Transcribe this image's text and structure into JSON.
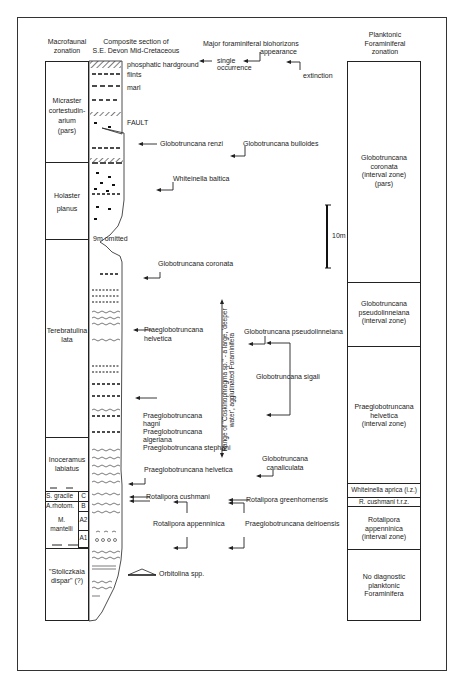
{
  "headers": {
    "macrofaunal": [
      "Macrofaunal",
      "zonation"
    ],
    "composite": [
      "Composite section of",
      "S.E. Devon Mid-Cretaceous"
    ],
    "biohorizons": "Major foraminiferal biohorizons",
    "appearance": "appearance",
    "single": [
      "single",
      "occurrence"
    ],
    "extinction": "extinction",
    "planktonic": [
      "Planktonic",
      "Foraminiferal",
      "zonation"
    ]
  },
  "lithology_labels": {
    "hardground": "phosphatic hardground",
    "flints": "flints",
    "marl": "marl",
    "fault": "FAULT",
    "omitted": "9m omitted"
  },
  "macrofaunal_zones": [
    {
      "lines": [
        "Micraster",
        "cortestudin-",
        "arium",
        "(pars)"
      ]
    },
    {
      "lines": [
        "Holaster",
        "planus"
      ]
    },
    {
      "lines": [
        "Terebratulina",
        "lata"
      ]
    },
    {
      "lines": [
        "Inoceramus",
        "labiatus"
      ]
    },
    {
      "lines": [
        "S. gracile"
      ],
      "sub": "C"
    },
    {
      "lines": [
        "A.rhotom."
      ],
      "sub": "B"
    },
    {
      "lines": [
        "M.",
        "mantelli"
      ],
      "subs": [
        "A2",
        "A1"
      ]
    },
    {
      "lines": [
        "\"Stoliczkaia",
        "dispar\"  (?)"
      ]
    }
  ],
  "biohorizons": [
    {
      "name": "Globotruncana renzi"
    },
    {
      "name": "Globotruncana bulloides"
    },
    {
      "name": "Whiteinella baltica"
    },
    {
      "name": "Globotruncana coronata"
    },
    {
      "name": "Praeglobotruncana helvetica",
      "lines": [
        "Praeglobotruncana",
        "helvetica"
      ]
    },
    {
      "name": "Globotruncana pseudolinneiana"
    },
    {
      "name": "Globotruncana sigali"
    },
    {
      "name": "Praeglobotruncana hagni",
      "lines": [
        "Praeglobotruncana",
        "hagni"
      ]
    },
    {
      "name": "Praeglobotruncana algeriana",
      "lines": [
        "Praeglobotruncana",
        "algeriana"
      ]
    },
    {
      "name": "Praeglobotruncana stephani"
    },
    {
      "name": "Praeglobotruncana helvetica (lower)",
      "lines": [
        "Praeglobotruncana helvetica"
      ]
    },
    {
      "name": "Globotruncana canaliculata",
      "lines": [
        "Globotruncana",
        "canaliculata"
      ]
    },
    {
      "name": "Rotalipora cushmani"
    },
    {
      "name": "Rotalipora greenhornensis"
    },
    {
      "name": "Rotalipora appenninica"
    },
    {
      "name": "Praeglobotruncana delrioensis"
    },
    {
      "name": "Orbitolina spp."
    }
  ],
  "range_note": "Range of \"Coskinophragma sp.\" - a large, 'deeper water', agglutinated Foraminifera",
  "scale_bar": "10m",
  "planktonic_zones": [
    {
      "lines": [
        "Globotruncana",
        "coronata",
        "(interval zone)",
        "(pars)"
      ]
    },
    {
      "lines": [
        "Globotruncana",
        "pseudolinneiana",
        "(interval zone)"
      ]
    },
    {
      "lines": [
        "Praeglobotruncana",
        "helvetica",
        "(interval zone)"
      ]
    },
    {
      "lines": [
        "Whiteinella aprica (i.z.)"
      ]
    },
    {
      "lines": [
        "R. cushmani t.r.z."
      ]
    },
    {
      "lines": [
        "Rotalipora",
        "appenninica",
        "(interval zone)"
      ]
    },
    {
      "lines": [
        "No diagnostic",
        "planktonic",
        "Foraminifera"
      ]
    }
  ]
}
